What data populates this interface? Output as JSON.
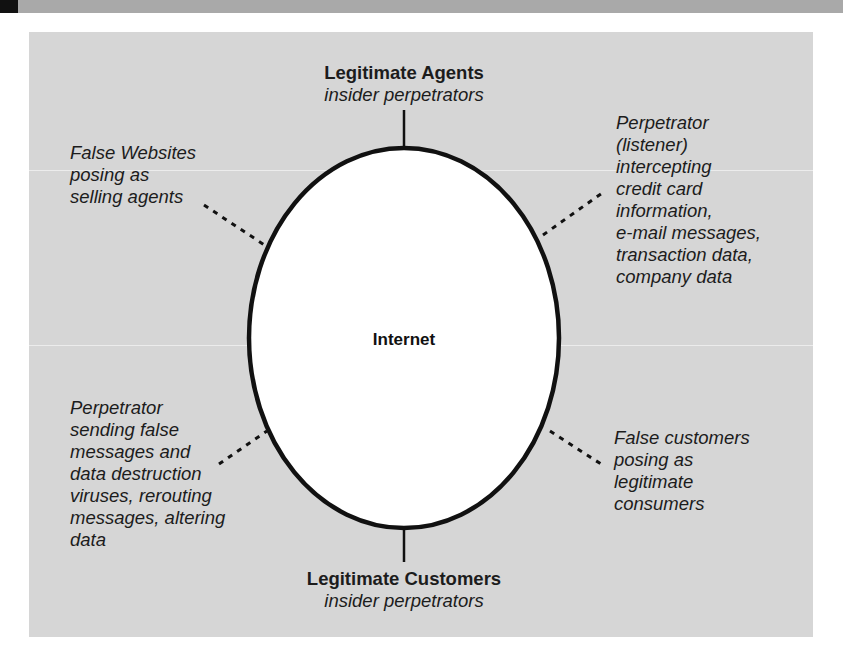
{
  "figure": {
    "center_node": "Internet",
    "top_node": {
      "title": "Legitimate Agents",
      "subtitle": "insider perpetrators"
    },
    "bottom_node": {
      "title": "Legitimate Customers",
      "subtitle": "insider perpetrators"
    },
    "threats": {
      "top_left": {
        "lines": [
          "False Websites",
          "posing as",
          "selling agents"
        ]
      },
      "top_right": {
        "lines": [
          "Perpetrator",
          "(listener)",
          "intercepting",
          "credit card",
          "information,",
          "e-mail messages,",
          "transaction data,",
          "company data"
        ]
      },
      "bottom_left": {
        "lines": [
          "Perpetrator",
          "sending false",
          "messages and",
          "data destruction",
          "viruses, rerouting",
          "messages, altering",
          "data"
        ]
      },
      "bottom_right": {
        "lines": [
          "False customers",
          "posing as",
          "legitimate",
          "consumers"
        ]
      }
    },
    "colors": {
      "panel_bg": "#d6d6d6",
      "ellipse_fill": "#ffffff",
      "stroke": "#111111",
      "top_strip": "#a9a9a9"
    }
  }
}
